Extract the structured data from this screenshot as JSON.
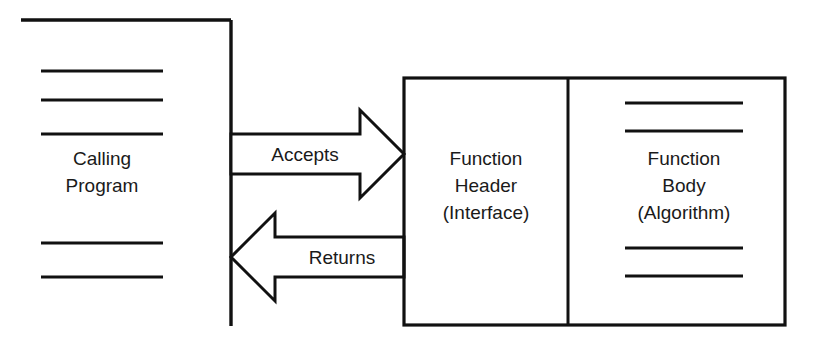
{
  "diagram": {
    "type": "block-diagram",
    "background_color": "#ffffff",
    "line_color": "#111111",
    "text_color": "#1a1a1a"
  },
  "calling_program": {
    "label_line1": "Calling",
    "label_line2": "Program",
    "code_line_count_above": 3,
    "code_line_count_below": 2
  },
  "function_box": {
    "header": {
      "label_line1": "Function",
      "label_line2": "Header",
      "label_line3": "(Interface)"
    },
    "body": {
      "label_line1": "Function",
      "label_line2": "Body",
      "label_line3": "(Algorithm)",
      "code_line_count_above": 2,
      "code_line_count_below": 2
    }
  },
  "arrows": {
    "accepts": {
      "label": "Accepts",
      "direction": "right"
    },
    "returns": {
      "label": "Returns",
      "direction": "left"
    }
  }
}
